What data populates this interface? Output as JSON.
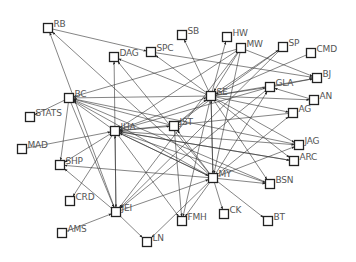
{
  "diagram": {
    "type": "directed-network-graph",
    "node_shape": "square",
    "colors": {
      "edge": "#333333",
      "node_border": "#222222",
      "label": "#555555",
      "background": "#ffffff"
    },
    "nodes": [
      {
        "id": "RB",
        "label": "RB",
        "x": 48,
        "y": 28
      },
      {
        "id": "SB",
        "label": "SB",
        "x": 182,
        "y": 35
      },
      {
        "id": "HW",
        "label": "HW",
        "x": 227,
        "y": 37
      },
      {
        "id": "MW",
        "label": "MW",
        "x": 241,
        "y": 48
      },
      {
        "id": "SP",
        "label": "SP",
        "x": 283,
        "y": 47
      },
      {
        "id": "CMD",
        "label": "CMD",
        "x": 311,
        "y": 53
      },
      {
        "id": "DAG",
        "label": "DAG",
        "x": 114,
        "y": 57
      },
      {
        "id": "SPC",
        "label": "SPC",
        "x": 151,
        "y": 52
      },
      {
        "id": "BJ",
        "label": "BJ",
        "x": 317,
        "y": 78
      },
      {
        "id": "SE",
        "label": "SE",
        "x": 211,
        "y": 96
      },
      {
        "id": "GLA",
        "label": "GLA",
        "x": 270,
        "y": 87
      },
      {
        "id": "AN",
        "label": "AN",
        "x": 314,
        "y": 100
      },
      {
        "id": "BC",
        "label": "BC",
        "x": 69,
        "y": 98
      },
      {
        "id": "AG",
        "label": "AG",
        "x": 293,
        "y": 113
      },
      {
        "id": "STATS",
        "label": "STATS",
        "x": 30,
        "y": 117
      },
      {
        "id": "IHA",
        "label": "IHA",
        "x": 115,
        "y": 131
      },
      {
        "id": "JST",
        "label": "JST",
        "x": 174,
        "y": 126
      },
      {
        "id": "MAD",
        "label": "MAD",
        "x": 22,
        "y": 149
      },
      {
        "id": "JAG",
        "label": "JAG",
        "x": 299,
        "y": 145
      },
      {
        "id": "ARC",
        "label": "ARC",
        "x": 294,
        "y": 161
      },
      {
        "id": "SHP",
        "label": "SHP",
        "x": 60,
        "y": 165
      },
      {
        "id": "MY",
        "label": "MY",
        "x": 213,
        "y": 178
      },
      {
        "id": "BSN",
        "label": "BSN",
        "x": 270,
        "y": 184
      },
      {
        "id": "CRD",
        "label": "CRD",
        "x": 70,
        "y": 201
      },
      {
        "id": "JEI",
        "label": "JEI",
        "x": 116,
        "y": 212
      },
      {
        "id": "CK",
        "label": "CK",
        "x": 224,
        "y": 214
      },
      {
        "id": "FMH",
        "label": "FMH",
        "x": 182,
        "y": 221
      },
      {
        "id": "BT",
        "label": "BT",
        "x": 268,
        "y": 221
      },
      {
        "id": "AMS",
        "label": "AMS",
        "x": 62,
        "y": 233
      },
      {
        "id": "LN",
        "label": "LN",
        "x": 147,
        "y": 242
      }
    ],
    "edges": [
      [
        "RB",
        "SPC"
      ],
      [
        "JEI",
        "RB"
      ],
      [
        "MY",
        "RB"
      ],
      [
        "IHA",
        "DAG"
      ],
      [
        "MY",
        "DAG"
      ],
      [
        "SE",
        "DAG"
      ],
      [
        "SE",
        "SPC"
      ],
      [
        "SE",
        "SB"
      ],
      [
        "SE",
        "HW"
      ],
      [
        "SE",
        "BJ"
      ],
      [
        "SE",
        "GLA"
      ],
      [
        "SE",
        "AN"
      ],
      [
        "SE",
        "AG"
      ],
      [
        "SE",
        "JAG"
      ],
      [
        "SE",
        "ARC"
      ],
      [
        "SE",
        "BSN"
      ],
      [
        "SE",
        "MY"
      ],
      [
        "SE",
        "FMH"
      ],
      [
        "SE",
        "BC"
      ],
      [
        "SE",
        "SP"
      ],
      [
        "MW",
        "SE"
      ],
      [
        "MW",
        "IHA"
      ],
      [
        "MW",
        "BC"
      ],
      [
        "MW",
        "JEI"
      ],
      [
        "MW",
        "MY"
      ],
      [
        "MW",
        "BJ"
      ],
      [
        "SPC",
        "BJ"
      ],
      [
        "SP",
        "JEI"
      ],
      [
        "SP",
        "JST"
      ],
      [
        "CMD",
        "SE"
      ],
      [
        "GLA",
        "BJ"
      ],
      [
        "GLA",
        "IHA"
      ],
      [
        "GLA",
        "JEI"
      ],
      [
        "BC",
        "STATS"
      ],
      [
        "BC",
        "SHP"
      ],
      [
        "BC",
        "JEI"
      ],
      [
        "IHA",
        "BC"
      ],
      [
        "IHA",
        "SE"
      ],
      [
        "IHA",
        "JST"
      ],
      [
        "IHA",
        "MY"
      ],
      [
        "IHA",
        "BSN"
      ],
      [
        "IHA",
        "JAG"
      ],
      [
        "IHA",
        "ARC"
      ],
      [
        "IHA",
        "JEI"
      ],
      [
        "IHA",
        "CRD"
      ],
      [
        "IHA",
        "FMH"
      ],
      [
        "IHA",
        "SHP"
      ],
      [
        "JST",
        "SE"
      ],
      [
        "JST",
        "BC"
      ],
      [
        "JST",
        "FMH"
      ],
      [
        "MAD",
        "IHA"
      ],
      [
        "MY",
        "SE"
      ],
      [
        "MY",
        "JST"
      ],
      [
        "MY",
        "BC"
      ],
      [
        "MY",
        "SHP"
      ],
      [
        "MY",
        "IHA"
      ],
      [
        "MY",
        "JAG"
      ],
      [
        "MY",
        "AG"
      ],
      [
        "MY",
        "CK"
      ],
      [
        "MY",
        "BT"
      ],
      [
        "MY",
        "FMH"
      ],
      [
        "MY",
        "LN"
      ],
      [
        "MY",
        "GLA"
      ],
      [
        "MY",
        "BSN"
      ],
      [
        "JEI",
        "SHP"
      ],
      [
        "JEI",
        "LN"
      ],
      [
        "JEI",
        "MY"
      ],
      [
        "JEI",
        "IHA"
      ],
      [
        "AMS",
        "JEI"
      ],
      [
        "BSN",
        "BC"
      ],
      [
        "ARC",
        "IHA"
      ],
      [
        "JAG",
        "BC"
      ],
      [
        "AG",
        "IHA"
      ],
      [
        "AN",
        "GLA"
      ]
    ]
  }
}
